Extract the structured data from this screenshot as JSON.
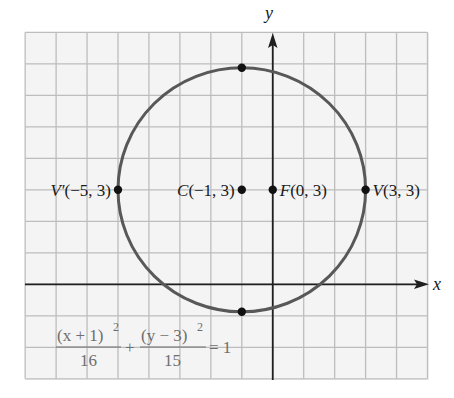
{
  "figure": {
    "axes": {
      "x_label": "x",
      "y_label": "y",
      "x_grid_range": [
        -8,
        5
      ],
      "y_grid_range": [
        -3,
        8
      ]
    },
    "ellipse": {
      "center": [
        -1,
        3
      ],
      "a": 4,
      "b_squared": 15,
      "orientation": "horizontal"
    },
    "points": [
      {
        "id": "v-prime",
        "label_main": "V′",
        "label_coords": "(−5, 3)",
        "x": -5,
        "y": 3,
        "label_side": "left"
      },
      {
        "id": "center",
        "label_main": "C",
        "label_coords": "(−1, 3)",
        "x": -1,
        "y": 3,
        "label_side": "left"
      },
      {
        "id": "focus",
        "label_main": "F",
        "label_coords": "(0, 3)",
        "x": 0,
        "y": 3,
        "label_side": "right"
      },
      {
        "id": "vertex",
        "label_main": "V",
        "label_coords": "(3, 3)",
        "x": 3,
        "y": 3,
        "label_side": "right"
      },
      {
        "id": "covertex-top",
        "x": -1,
        "y": 6.873
      },
      {
        "id": "covertex-bottom",
        "x": -1,
        "y": -0.873
      }
    ],
    "equation": {
      "num1": "(x + 1)",
      "exp1": "2",
      "den1": "16",
      "plus": "+",
      "num2": "(y − 3)",
      "exp2": "2",
      "den2": "15",
      "equals": "= 1"
    },
    "colors": {
      "background": "#f4f4f4",
      "grid": "#bdbdbd",
      "axis": "#1f1f1f",
      "curve": "#585858",
      "point": "#111111",
      "equation": "#6e6e6e"
    }
  }
}
